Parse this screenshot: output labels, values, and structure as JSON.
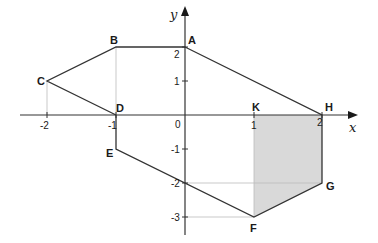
{
  "diagram": {
    "axes": {
      "x_label": "x",
      "y_label": "y",
      "origin_label": "0",
      "x_ticks": [
        {
          "value": -2,
          "label": "-2"
        },
        {
          "value": -1,
          "label": "-1"
        },
        {
          "value": 1,
          "label": "1"
        },
        {
          "value": 2,
          "label": "2"
        }
      ],
      "y_ticks": [
        {
          "value": 2,
          "label": "2"
        },
        {
          "value": 1,
          "label": "1"
        },
        {
          "value": -1,
          "label": "-1"
        },
        {
          "value": -2,
          "label": "-2"
        },
        {
          "value": -3,
          "label": "-3"
        }
      ]
    },
    "points": [
      {
        "name": "A",
        "x": 0,
        "y": 2
      },
      {
        "name": "B",
        "x": -1,
        "y": 2
      },
      {
        "name": "C",
        "x": -2,
        "y": 1
      },
      {
        "name": "D",
        "x": -1,
        "y": 0
      },
      {
        "name": "E",
        "x": -1,
        "y": -1
      },
      {
        "name": "F",
        "x": 1,
        "y": -3
      },
      {
        "name": "G",
        "x": 2,
        "y": -2
      },
      {
        "name": "H",
        "x": 2,
        "y": 0
      },
      {
        "name": "K",
        "x": 1,
        "y": 0
      }
    ],
    "polygon": [
      "A",
      "B",
      "C",
      "D",
      "E",
      "F",
      "G",
      "H"
    ],
    "shaded_region": [
      "K",
      "H",
      "G",
      "F"
    ],
    "colors": {
      "line": "#333333",
      "shade": "#d9d9d9",
      "guide": "#bbbbbb"
    }
  }
}
